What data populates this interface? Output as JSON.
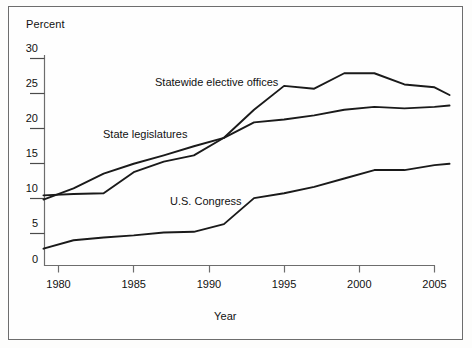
{
  "figure": {
    "background": "#fefefe",
    "border_color": "#6d6d6d",
    "line_color": "#1a1a1a",
    "axis_color": "#6d6d6d"
  },
  "labels": {
    "y_axis_title": "Percent",
    "x_axis_title": "Year"
  },
  "series_labels": {
    "statewide": "Statewide elective offices",
    "legislatures": "State legislatures",
    "congress": "U.S. Congress"
  },
  "chart_data": {
    "type": "line",
    "title": "",
    "subtitle": "",
    "xlabel": "Year",
    "ylabel": "Percent",
    "xlim": [
      1979,
      2006
    ],
    "ylim": [
      0,
      30
    ],
    "xticks": [
      1980,
      1985,
      1990,
      1995,
      2000,
      2005
    ],
    "xtick_labels": [
      "1980",
      "1985",
      "1990",
      "1995",
      "2000",
      "2005"
    ],
    "yticks": [
      0,
      5,
      10,
      15,
      20,
      25,
      30
    ],
    "ytick_labels": [
      "0",
      "5",
      "10",
      "15",
      "20",
      "25",
      "30"
    ],
    "grid": false,
    "legend": "inline-annotations",
    "x": [
      1979,
      1981,
      1983,
      1985,
      1987,
      1989,
      1991,
      1993,
      1995,
      1997,
      1999,
      2001,
      2003,
      2005,
      2006
    ],
    "series": [
      {
        "name": "Statewide elective offices",
        "label_position": "above-line",
        "values": [
          9.4,
          11.0,
          13.1,
          14.5,
          15.7,
          17.0,
          18.2,
          22.2,
          25.6,
          25.2,
          27.4,
          27.4,
          25.8,
          25.4,
          24.3
        ]
      },
      {
        "name": "State legislatures",
        "label_position": "above-line",
        "values": [
          10.0,
          10.2,
          10.3,
          13.3,
          14.8,
          15.7,
          18.2,
          20.4,
          20.8,
          21.4,
          22.2,
          22.6,
          22.4,
          22.6,
          22.8
        ]
      },
      {
        "name": "U.S. Congress",
        "label_position": "above-line",
        "values": [
          2.4,
          3.6,
          4.0,
          4.3,
          4.7,
          4.8,
          5.9,
          9.6,
          10.3,
          11.2,
          12.4,
          13.6,
          13.6,
          14.3,
          14.5
        ]
      }
    ]
  }
}
